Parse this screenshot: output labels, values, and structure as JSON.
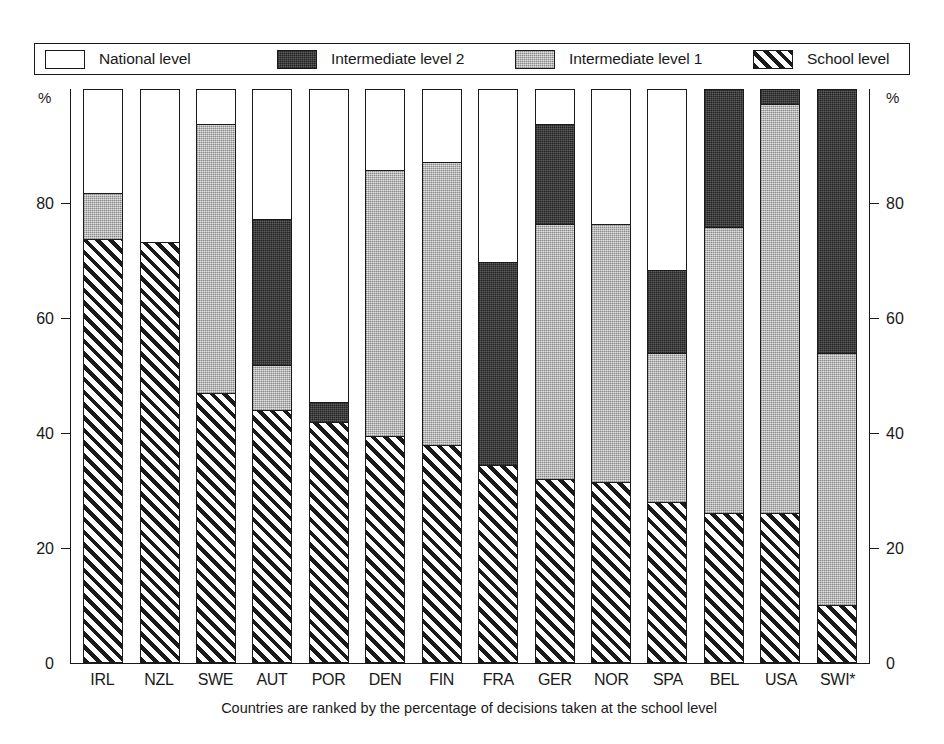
{
  "legend": {
    "items": [
      {
        "label": "National level",
        "key": "national",
        "color": "#ffffff",
        "pattern": "solid-white"
      },
      {
        "label": "Intermediate level 2",
        "key": "int2",
        "color": "#4a4a4a",
        "pattern": "dark-gray"
      },
      {
        "label": "Intermediate level 1",
        "key": "int1",
        "color": "#b4b4b4",
        "pattern": "light-gray"
      },
      {
        "label": "School level",
        "key": "school",
        "color": "#1a1a1a",
        "pattern": "diagonal-hatch"
      }
    ]
  },
  "axis": {
    "unit_top_left": "%",
    "unit_top_right": "%",
    "ticks": [
      "0",
      "20",
      "40",
      "60",
      "80"
    ]
  },
  "footnote": "Countries are ranked by the percentage of decisions taken at the school level",
  "chart_data": {
    "type": "bar",
    "stacked": true,
    "title": "",
    "xlabel": "",
    "ylabel": "%",
    "ylim": [
      0,
      100
    ],
    "yticks": [
      0,
      20,
      40,
      60,
      80
    ],
    "grid": false,
    "legend_position": "top",
    "categories": [
      "IRL",
      "NZL",
      "SWE",
      "AUT",
      "POR",
      "DEN",
      "FIN",
      "FRA",
      "GER",
      "NOR",
      "SPA",
      "BEL",
      "USA",
      "SWI*"
    ],
    "series": [
      {
        "name": "School level",
        "values": [
          74.0,
          73.5,
          47.0,
          44.0,
          42.0,
          39.5,
          38.0,
          34.5,
          32.0,
          31.5,
          28.0,
          26.0,
          26.0,
          10.0
        ]
      },
      {
        "name": "Intermediate level 1",
        "values": [
          8.0,
          0.0,
          47.0,
          8.0,
          0.0,
          46.5,
          49.5,
          0.0,
          44.5,
          45.0,
          26.0,
          50.0,
          71.5,
          44.0
        ]
      },
      {
        "name": "Intermediate level 2",
        "values": [
          0.0,
          0.0,
          0.0,
          25.5,
          3.5,
          0.0,
          0.0,
          35.5,
          17.5,
          0.0,
          14.5,
          24.0,
          2.5,
          46.0
        ]
      },
      {
        "name": "National level",
        "values": [
          18.0,
          26.5,
          6.0,
          22.5,
          54.5,
          14.0,
          12.5,
          30.0,
          6.0,
          23.5,
          31.5,
          0.0,
          0.0,
          0.0
        ]
      }
    ]
  }
}
